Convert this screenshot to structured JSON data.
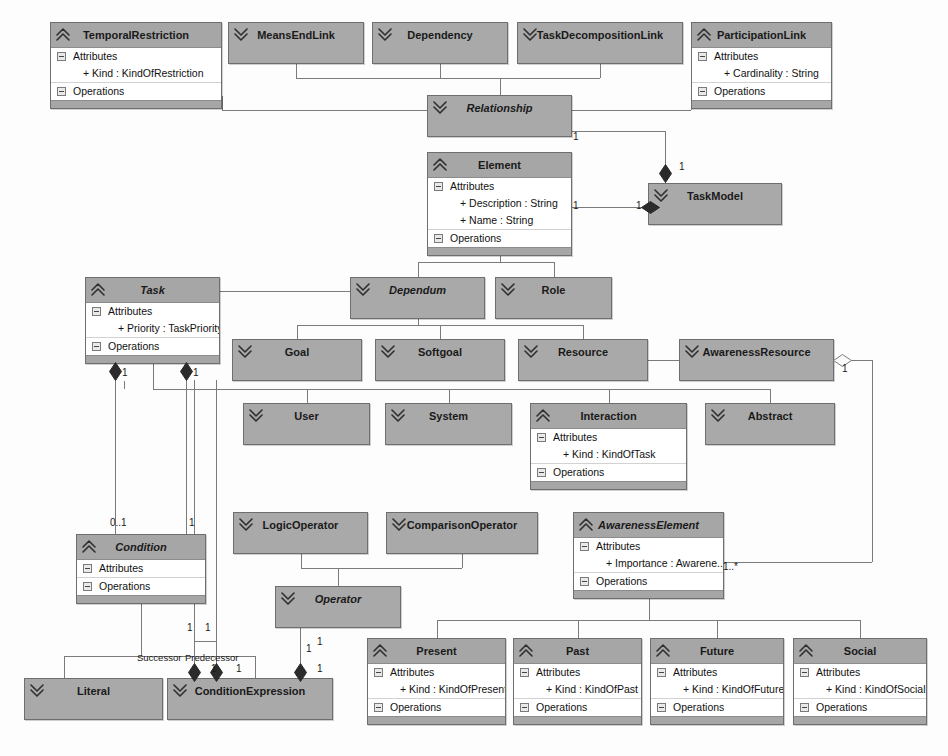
{
  "diagram": {
    "colors": {
      "class_fill": "#a9a9a9",
      "header_fill": "#a6a6a6",
      "body_fill": "#ffffff",
      "border": "#6e6e6e",
      "line": "#7b7b7b",
      "diamond_filled": "#2b2b2b",
      "diamond_open": "#fafafa",
      "background": "#fdfdfd"
    },
    "section_labels": {
      "attributes": "Attributes",
      "operations": "Operations"
    },
    "classes": [
      {
        "id": "temporal-restriction",
        "name": "TemporalRestriction",
        "abstract": false,
        "collapsed": false,
        "icon": "chevron-up-double-icon",
        "x": 50,
        "y": 22,
        "w": 172,
        "attributes": [
          "+ Kind : KindOfRestriction"
        ]
      },
      {
        "id": "means-end-link",
        "name": "MeansEndLink",
        "abstract": false,
        "collapsed": true,
        "icon": "chevron-down-double-icon",
        "x": 228,
        "y": 22,
        "w": 136,
        "attributes": []
      },
      {
        "id": "dependency",
        "name": "Dependency",
        "abstract": false,
        "collapsed": true,
        "icon": "chevron-down-double-icon",
        "x": 372,
        "y": 22,
        "w": 136,
        "attributes": []
      },
      {
        "id": "task-decomposition-link",
        "name": "TaskDecompositionLink",
        "abstract": false,
        "collapsed": true,
        "icon": "chevron-down-double-icon",
        "x": 517,
        "y": 22,
        "w": 166,
        "attributes": []
      },
      {
        "id": "participation-link",
        "name": "ParticipationLink",
        "abstract": false,
        "collapsed": false,
        "icon": "chevron-up-double-icon",
        "x": 691,
        "y": 22,
        "w": 141,
        "attributes": [
          "+ Cardinality : String"
        ]
      },
      {
        "id": "relationship",
        "name": "Relationship",
        "abstract": true,
        "collapsed": true,
        "icon": "chevron-down-double-icon",
        "x": 427,
        "y": 95,
        "w": 145,
        "attributes": []
      },
      {
        "id": "element",
        "name": "Element",
        "abstract": false,
        "collapsed": false,
        "icon": "chevron-up-double-icon",
        "x": 427,
        "y": 152,
        "w": 145,
        "attributes": [
          "+ Description : String",
          "+ Name : String"
        ]
      },
      {
        "id": "task-model",
        "name": "TaskModel",
        "abstract": false,
        "collapsed": true,
        "icon": "chevron-down-double-icon",
        "x": 648,
        "y": 183,
        "w": 134,
        "attributes": []
      },
      {
        "id": "task",
        "name": "Task",
        "abstract": true,
        "collapsed": false,
        "icon": "chevron-up-double-icon",
        "x": 85,
        "y": 277,
        "w": 135,
        "attributes": [
          "+ Priority : TaskPriority"
        ]
      },
      {
        "id": "dependum",
        "name": "Dependum",
        "abstract": true,
        "collapsed": true,
        "icon": "chevron-down-double-icon",
        "x": 350,
        "y": 277,
        "w": 135,
        "attributes": []
      },
      {
        "id": "role",
        "name": "Role",
        "abstract": false,
        "collapsed": true,
        "icon": "chevron-down-double-icon",
        "x": 495,
        "y": 277,
        "w": 117,
        "attributes": []
      },
      {
        "id": "goal",
        "name": "Goal",
        "abstract": false,
        "collapsed": true,
        "icon": "chevron-down-double-icon",
        "x": 232,
        "y": 339,
        "w": 130,
        "attributes": []
      },
      {
        "id": "softgoal",
        "name": "Softgoal",
        "abstract": false,
        "collapsed": true,
        "icon": "chevron-down-double-icon",
        "x": 375,
        "y": 339,
        "w": 130,
        "attributes": []
      },
      {
        "id": "resource",
        "name": "Resource",
        "abstract": false,
        "collapsed": true,
        "icon": "chevron-down-double-icon",
        "x": 518,
        "y": 339,
        "w": 130,
        "attributes": []
      },
      {
        "id": "awareness-resource",
        "name": "AwarenessResource",
        "abstract": false,
        "collapsed": true,
        "icon": "chevron-down-double-icon",
        "x": 679,
        "y": 339,
        "w": 155,
        "attributes": []
      },
      {
        "id": "user",
        "name": "User",
        "abstract": false,
        "collapsed": true,
        "icon": "chevron-down-double-icon",
        "x": 243,
        "y": 403,
        "w": 127,
        "attributes": []
      },
      {
        "id": "system",
        "name": "System",
        "abstract": false,
        "collapsed": true,
        "icon": "chevron-down-double-icon",
        "x": 385,
        "y": 403,
        "w": 127,
        "attributes": []
      },
      {
        "id": "interaction",
        "name": "Interaction",
        "abstract": false,
        "collapsed": false,
        "icon": "chevron-up-double-icon",
        "x": 530,
        "y": 403,
        "w": 157,
        "attributes": [
          "+ Kind : KindOfTask"
        ]
      },
      {
        "id": "abstract",
        "name": "Abstract",
        "abstract": false,
        "collapsed": true,
        "icon": "chevron-down-double-icon",
        "x": 705,
        "y": 403,
        "w": 130,
        "attributes": []
      },
      {
        "id": "logic-operator",
        "name": "LogicOperator",
        "abstract": false,
        "collapsed": true,
        "icon": "chevron-down-double-icon",
        "x": 233,
        "y": 512,
        "w": 135,
        "attributes": []
      },
      {
        "id": "comparison-operator",
        "name": "ComparisonOperator",
        "abstract": false,
        "collapsed": true,
        "icon": "chevron-down-double-icon",
        "x": 386,
        "y": 512,
        "w": 152,
        "attributes": []
      },
      {
        "id": "awareness-element",
        "name": "AwarenessElement",
        "abstract": true,
        "collapsed": false,
        "icon": "chevron-up-double-icon",
        "x": 573,
        "y": 512,
        "w": 151,
        "attributes": [
          "+ Importance : Awarene..."
        ]
      },
      {
        "id": "condition",
        "name": "Condition",
        "abstract": true,
        "collapsed": false,
        "icon": "chevron-up-double-icon",
        "x": 76,
        "y": 534,
        "w": 130,
        "attributes": []
      },
      {
        "id": "operator",
        "name": "Operator",
        "abstract": true,
        "collapsed": true,
        "icon": "chevron-down-double-icon",
        "x": 275,
        "y": 586,
        "w": 126,
        "attributes": []
      },
      {
        "id": "present",
        "name": "Present",
        "abstract": false,
        "collapsed": false,
        "icon": "chevron-up-double-icon",
        "x": 367,
        "y": 638,
        "w": 139,
        "attributes": [
          "+ Kind : KindOfPresent"
        ]
      },
      {
        "id": "past",
        "name": "Past",
        "abstract": false,
        "collapsed": false,
        "icon": "chevron-up-double-icon",
        "x": 513,
        "y": 638,
        "w": 129,
        "attributes": [
          "+ Kind : KindOfPast"
        ]
      },
      {
        "id": "future",
        "name": "Future",
        "abstract": false,
        "collapsed": false,
        "icon": "chevron-up-double-icon",
        "x": 650,
        "y": 638,
        "w": 134,
        "attributes": [
          "+ Kind : KindOfFuture"
        ]
      },
      {
        "id": "social",
        "name": "Social",
        "abstract": false,
        "collapsed": false,
        "icon": "chevron-up-double-icon",
        "x": 793,
        "y": 638,
        "w": 134,
        "attributes": [
          "+ Kind : KindOfSocial"
        ]
      },
      {
        "id": "literal",
        "name": "Literal",
        "abstract": false,
        "collapsed": true,
        "icon": "chevron-down-double-icon",
        "x": 24,
        "y": 678,
        "w": 139,
        "attributes": []
      },
      {
        "id": "condition-expression",
        "name": "ConditionExpression",
        "abstract": false,
        "collapsed": true,
        "icon": "chevron-down-double-icon",
        "x": 167,
        "y": 678,
        "w": 166,
        "attributes": []
      }
    ],
    "multiplicities": [
      {
        "id": "mult-relationship-taskmodel-src",
        "text": "1",
        "x": 573,
        "y": 131
      },
      {
        "id": "mult-taskmodel-relationship",
        "text": "1",
        "x": 679,
        "y": 161
      },
      {
        "id": "mult-element-taskmodel-src",
        "text": "1",
        "x": 573,
        "y": 200
      },
      {
        "id": "mult-taskmodel-element",
        "text": "1",
        "x": 636,
        "y": 200
      },
      {
        "id": "mult-task-condition-left",
        "text": "1",
        "x": 122,
        "y": 367
      },
      {
        "id": "mult-task-condition-right",
        "text": "1",
        "x": 193,
        "y": 367
      },
      {
        "id": "mult-condition-0-1",
        "text": "0..1",
        "x": 110,
        "y": 517
      },
      {
        "id": "mult-condition-1",
        "text": "1",
        "x": 189,
        "y": 517
      },
      {
        "id": "mult-condition-succ",
        "text": "1",
        "x": 187,
        "y": 622
      },
      {
        "id": "mult-condition-pred",
        "text": "1",
        "x": 205,
        "y": 622
      },
      {
        "id": "mult-operator-expr",
        "text": "1",
        "x": 306,
        "y": 643
      },
      {
        "id": "mult-awareness-resource",
        "text": "1",
        "x": 842,
        "y": 363
      },
      {
        "id": "mult-awareness-element",
        "text": "1..*",
        "x": 723,
        "y": 561
      },
      {
        "id": "mult-succ-diamond",
        "text": "1",
        "x": 211,
        "y": 663
      },
      {
        "id": "mult-pred-diamond",
        "text": "1",
        "x": 236,
        "y": 663
      },
      {
        "id": "mult-expr-right",
        "text": "1",
        "x": 317,
        "y": 663
      },
      {
        "id": "mult-expr-right-top",
        "text": "1",
        "x": 317,
        "y": 636
      }
    ],
    "role_labels": [
      {
        "id": "role-successor",
        "text": "Successor",
        "x": 137,
        "y": 652
      },
      {
        "id": "role-predecessor",
        "text": "Predecessor",
        "x": 185,
        "y": 652
      }
    ]
  }
}
